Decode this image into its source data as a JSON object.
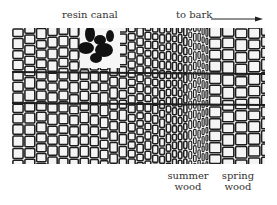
{
  "figure": {
    "labels": {
      "resin_canal": "resin canal",
      "to_bark": "to bark",
      "summer_wood_line1": "summer",
      "summer_wood_line2": "wood",
      "spring_wood_line1": "spring",
      "spring_wood_line2": "wood"
    },
    "icons": {
      "arrow": "arrow-right-icon"
    },
    "colors": {
      "cell_wall": "#1e1e1e",
      "cell_lumen": "#f4f4f4",
      "background": "#ffffff"
    }
  }
}
